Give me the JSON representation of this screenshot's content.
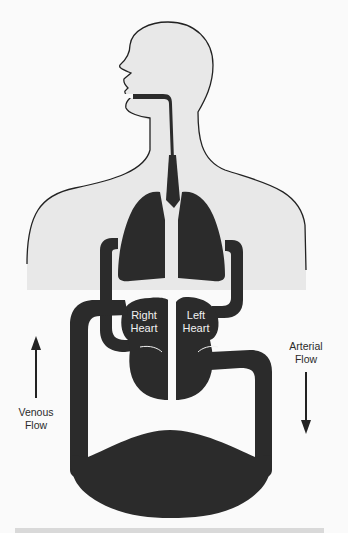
{
  "diagram": {
    "labels": {
      "right_heart": [
        "Right",
        "Heart"
      ],
      "left_heart": [
        "Left",
        "Heart"
      ],
      "venous_flow": [
        "Venous",
        "Flow"
      ],
      "arterial_flow": [
        "Arterial",
        "Flow"
      ]
    },
    "arrows": {
      "venous": "up",
      "arterial": "down"
    },
    "colors": {
      "background": "#fafafa",
      "body_fill": "#e8e8e8",
      "outline": "#222222",
      "organ_fill": "#2b2b2b",
      "text": "#2a2a2a",
      "bottom_bar": "#d9d9d9"
    }
  }
}
